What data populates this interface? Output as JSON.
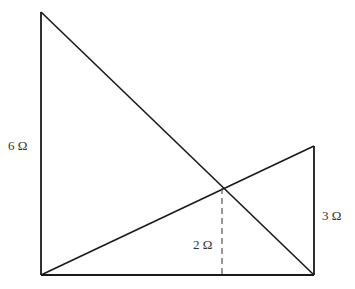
{
  "diagram": {
    "type": "crossed-ladders-resistance",
    "colors": {
      "line": "#1a1a1a",
      "dashed": "#555555",
      "text": "#333333",
      "background": "#ffffff"
    },
    "points": {
      "left_top": [
        41,
        12
      ],
      "left_bottom": [
        41,
        275
      ],
      "right_top": [
        314,
        146
      ],
      "right_bottom": [
        314,
        275
      ],
      "intersection": [
        222,
        188
      ],
      "intersection_foot": [
        222,
        275
      ]
    },
    "labels": {
      "left_height": "6 Ω",
      "intersection_height": "2 Ω",
      "right_height": "3 Ω"
    },
    "label_positions": {
      "left_height": [
        8,
        139
      ],
      "intersection_height": [
        193,
        238
      ],
      "right_height": [
        322,
        209
      ]
    }
  }
}
